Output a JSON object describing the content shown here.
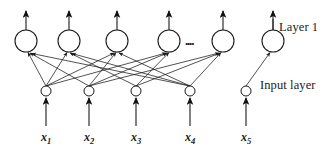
{
  "figure": {
    "background_color": "#ffffff",
    "stroke_color": "#1a1a1a",
    "node_fill": "#ffffff"
  },
  "annotations": {
    "layer_label": "Layer 1",
    "input_label": "Input layer",
    "ellipsis": "...."
  },
  "layer1": {
    "name": "Layer 1",
    "node_count": 6,
    "radius": 11,
    "center_y": 41,
    "nodes": [
      {
        "id": "layer1-node-1",
        "cx": 26,
        "cy": 41
      },
      {
        "id": "layer1-node-2",
        "cx": 69,
        "cy": 41
      },
      {
        "id": "layer1-node-3",
        "cx": 117,
        "cy": 41
      },
      {
        "id": "layer1-node-4",
        "cx": 169,
        "cy": 41
      },
      {
        "id": "layer1-node-5",
        "cx": 223,
        "cy": 41
      },
      {
        "id": "layer1-node-6",
        "cx": 273,
        "cy": 41
      }
    ],
    "output_arrow_top_y": 9
  },
  "input_layer": {
    "name": "Input layer",
    "node_count": 5,
    "radius": 5,
    "center_y": 91,
    "nodes": [
      {
        "id": "input-node-1",
        "cx": 46,
        "cy": 91,
        "variable": "x",
        "subscript": "1"
      },
      {
        "id": "input-node-2",
        "cx": 89,
        "cy": 91,
        "variable": "x",
        "subscript": "2"
      },
      {
        "id": "input-node-3",
        "cx": 136,
        "cy": 91,
        "variable": "x",
        "subscript": "3"
      },
      {
        "id": "input-node-4",
        "cx": 190,
        "cy": 91,
        "variable": "x",
        "subscript": "4"
      },
      {
        "id": "input-node-5",
        "cx": 246,
        "cy": 91,
        "variable": "x",
        "subscript": "5"
      }
    ],
    "feed_arrow_bottom_y": 126
  },
  "input_variables": [
    {
      "label": "x",
      "subscript": "1",
      "x": 46
    },
    {
      "label": "x",
      "subscript": "2",
      "x": 89
    },
    {
      "label": "x",
      "subscript": "3",
      "x": 136
    },
    {
      "label": "x",
      "subscript": "4",
      "x": 190
    },
    {
      "label": "x",
      "subscript": "5",
      "x": 246
    }
  ],
  "connections": [
    {
      "from": "input-node-1",
      "to": "layer1-node-1"
    },
    {
      "from": "input-node-1",
      "to": "layer1-node-2"
    },
    {
      "from": "input-node-1",
      "to": "layer1-node-3"
    },
    {
      "from": "input-node-1",
      "to": "layer1-node-4"
    },
    {
      "from": "input-node-2",
      "to": "layer1-node-1"
    },
    {
      "from": "input-node-2",
      "to": "layer1-node-3"
    },
    {
      "from": "input-node-2",
      "to": "layer1-node-4"
    },
    {
      "from": "input-node-2",
      "to": "layer1-node-5"
    },
    {
      "from": "input-node-3",
      "to": "layer1-node-2"
    },
    {
      "from": "input-node-3",
      "to": "layer1-node-4"
    },
    {
      "from": "input-node-3",
      "to": "layer1-node-5"
    },
    {
      "from": "input-node-4",
      "to": "layer1-node-1"
    },
    {
      "from": "input-node-4",
      "to": "layer1-node-2"
    },
    {
      "from": "input-node-4",
      "to": "layer1-node-3"
    },
    {
      "from": "input-node-4",
      "to": "layer1-node-5"
    },
    {
      "from": "input-node-5",
      "to": "layer1-node-6"
    }
  ]
}
